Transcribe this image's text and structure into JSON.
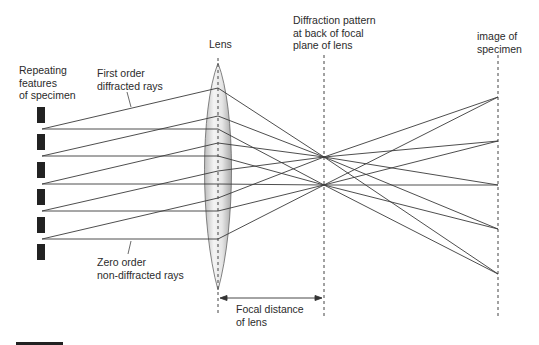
{
  "labels": {
    "lens": "Lens",
    "specimen": "Repeating\nfeatures\nof specimen",
    "first_order": "First order\ndiffracted rays",
    "zero_order": "Zero order\nnon-diffracted rays",
    "diffraction_pattern": "Diffraction pattern\nat back of focal\nplane of lens",
    "image": "image of\nspecimen",
    "focal_distance": "Focal distance\nof lens"
  },
  "colors": {
    "ray": "#3a3a3a",
    "specimen_block": "#222222",
    "lens_fill_light": "#f2f2f2",
    "lens_fill_dark": "#b8b8b8",
    "dashed": "#444444"
  },
  "geometry": {
    "lens_x": 218,
    "focal_plane_x": 324,
    "image_plane_x": 498,
    "source_x": 42,
    "sources_y": [
      129,
      156,
      184,
      211,
      239
    ],
    "first_order_lens_y": [
      88,
      116,
      143,
      171,
      198
    ],
    "focus_first_order_y": 157,
    "focus_zero_order_y": 185,
    "image_points_y": [
      97,
      141,
      185,
      229,
      274
    ],
    "specimen_blocks_y": [
      107,
      134,
      162,
      189,
      217,
      244
    ]
  }
}
